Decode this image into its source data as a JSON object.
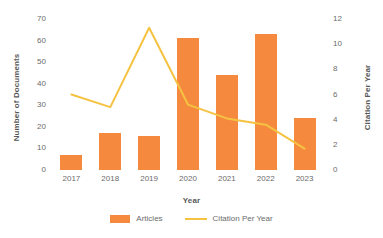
{
  "chart_data": {
    "type": "bar",
    "title": "",
    "categories": [
      "2017",
      "2018",
      "2019",
      "2020",
      "2021",
      "2022",
      "2023"
    ],
    "xlabel": "Year",
    "ylabel": "Number of Documents",
    "y2label": "Citation Per Year",
    "ylim": [
      0,
      70
    ],
    "y2lim": [
      0,
      12
    ],
    "yticks": [
      70,
      60,
      50,
      40,
      30,
      20,
      10,
      0
    ],
    "y2ticks": [
      12,
      10,
      8,
      6,
      4,
      2,
      0
    ],
    "grid": false,
    "legend_position": "bottom",
    "series": [
      {
        "name": "Articles",
        "type": "bar",
        "axis": "left",
        "color": "#F58A3E",
        "values": [
          7,
          17,
          16,
          61,
          44,
          63,
          24
        ]
      },
      {
        "name": "Citation Per Year",
        "type": "line",
        "axis": "right",
        "color": "#F5C242",
        "values": [
          6.0,
          5.0,
          11.3,
          5.2,
          4.1,
          3.6,
          1.7
        ]
      }
    ]
  },
  "legend": {
    "items": [
      {
        "label": "Articles",
        "marker": "bar-swatch-icon"
      },
      {
        "label": "Citation Per Year",
        "marker": "line-swatch-icon"
      }
    ]
  }
}
